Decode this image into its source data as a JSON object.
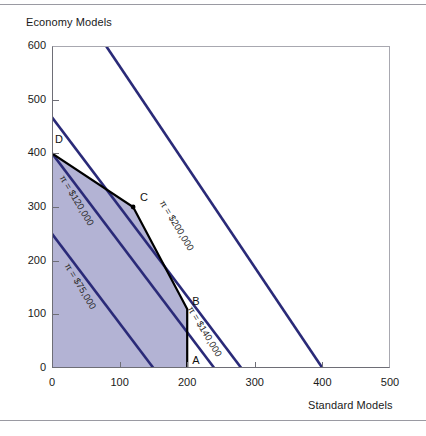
{
  "page": {
    "top_rule": "",
    "bottom_rule": ""
  },
  "axes": {
    "ylabel": "Economy Models",
    "xlabel": "Standard Models",
    "xticks": [
      "0",
      "100",
      "200",
      "300",
      "400",
      "500"
    ],
    "xtick_values": [
      0,
      100,
      200,
      300,
      400,
      500
    ],
    "yticks": [
      "0",
      "100",
      "200",
      "300",
      "400",
      "500",
      "600"
    ],
    "ytick_values": [
      0,
      100,
      200,
      300,
      400,
      500,
      600
    ],
    "xlim": [
      0,
      500
    ],
    "ylim": [
      0,
      600
    ]
  },
  "vertices": [
    {
      "label": "A",
      "x": 200,
      "y": 0
    },
    {
      "label": "B",
      "x": 200,
      "y": 110
    },
    {
      "label": "C",
      "x": 120,
      "y": 300
    },
    {
      "label": "D",
      "x": 0,
      "y": 400
    }
  ],
  "iso_labels": [
    {
      "text": "π = $75,000"
    },
    {
      "text": "π = $120,000"
    },
    {
      "text": "π = $140,000"
    },
    {
      "text": "π = $200,000"
    }
  ],
  "colors": {
    "iso_line": "#2a2a78",
    "feasible_fill": "#b3b3d4",
    "feasible_edge": "#000000",
    "frame": "#6e6e76",
    "rule": "#9a9aa2"
  },
  "chart_data": {
    "type": "line",
    "title": "",
    "xlabel": "Standard Models",
    "ylabel": "Economy Models",
    "xlim": [
      0,
      500
    ],
    "ylim": [
      0,
      600
    ],
    "grid": false,
    "legend": "inline-annotations",
    "series": [
      {
        "name": "π = $75,000",
        "kind": "iso-profit-line",
        "x": [
          0,
          150
        ],
        "y": [
          250,
          0
        ],
        "slope": -1.6667,
        "x_intercept": 150,
        "y_intercept": 250
      },
      {
        "name": "π = $120,000",
        "kind": "iso-profit-line",
        "x": [
          0,
          240
        ],
        "y": [
          400,
          0
        ],
        "slope": -1.6667,
        "x_intercept": 240,
        "y_intercept": 400
      },
      {
        "name": "π = $140,000",
        "kind": "iso-profit-line",
        "x": [
          0,
          280
        ],
        "y": [
          467,
          0
        ],
        "slope": -1.6667,
        "x_intercept": 280,
        "y_intercept": 467
      },
      {
        "name": "π = $200,000",
        "kind": "iso-profit-line",
        "x": [
          80,
          400
        ],
        "y": [
          600,
          0
        ],
        "slope": -1.6667,
        "x_intercept": 400,
        "y_intercept": 667
      }
    ],
    "feasible_region": {
      "name": "feasible region",
      "fill": "#b3b3d4",
      "vertices": [
        {
          "label": "origin",
          "x": 0,
          "y": 0
        },
        {
          "label": "D",
          "x": 0,
          "y": 400
        },
        {
          "label": "C",
          "x": 120,
          "y": 300
        },
        {
          "label": "B",
          "x": 200,
          "y": 110
        },
        {
          "label": "A",
          "x": 200,
          "y": 0
        }
      ]
    }
  }
}
